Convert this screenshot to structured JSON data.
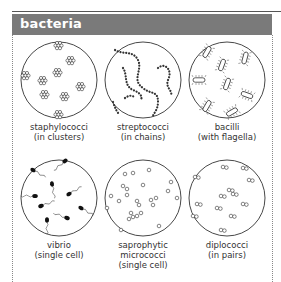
{
  "header": {
    "title": "bacteria",
    "background": "#7a7a7a"
  },
  "items": [
    {
      "name": "staphylococci",
      "detail": "(in clusters)"
    },
    {
      "name": "streptococci",
      "detail": "(in chains)"
    },
    {
      "name": "bacilli",
      "detail": "(with flagella)"
    },
    {
      "name": "vibrio",
      "detail": "(single cell)"
    },
    {
      "name": "saprophytic",
      "name2": "micrococci",
      "detail": "(single cell)"
    },
    {
      "name": "diplococci",
      "detail": "(in pairs)"
    }
  ]
}
